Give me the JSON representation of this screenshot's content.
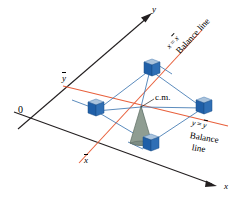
{
  "figure": {
    "type": "3d-axes-schematic"
  },
  "axes": {
    "origin_label": "0",
    "x_axis_label": "x",
    "y_axis_label": "y",
    "x_bar_tick_label": "x",
    "x_bar_has_overline": true,
    "y_bar_tick_label": "y",
    "y_bar_has_overline": true,
    "axis_color": "#231f20"
  },
  "balance_lines": [
    {
      "id": "x-equals-xbar",
      "equation_lhs": "x",
      "equation_op": "=",
      "equation_rhs": "x",
      "rhs_has_overline": true,
      "caption": "Balance line",
      "color": "#e8603c"
    },
    {
      "id": "y-equals-ybar",
      "equation_lhs": "y",
      "equation_op": "=",
      "equation_rhs": "y",
      "rhs_has_overline": true,
      "caption_line_1": "Balance",
      "caption_line_2": "line",
      "color": "#e8603c"
    }
  ],
  "center_of_mass": {
    "label": "c.m.",
    "leader_line": true
  },
  "fulcrum": {
    "name": "cone-support",
    "fill_color": "#8f9d92",
    "stroke_color": "#5b6b62"
  },
  "masses": {
    "count": 4,
    "cube_face_color": "#1f5fa8",
    "cube_top_color": "#9db9d6",
    "cube_side_color": "#7fa3c6",
    "connector_color": "#4a7fb5",
    "positions": [
      "top",
      "left",
      "right",
      "bottom"
    ]
  },
  "colors": {
    "background": "#ffffff",
    "axis": "#231f20",
    "balance_line": "#e8603c",
    "frame": "#4a7fb5",
    "cone": "#8f9d92"
  }
}
